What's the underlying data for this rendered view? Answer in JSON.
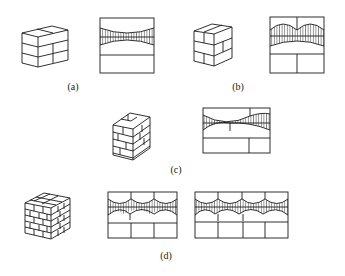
{
  "figure": {
    "panels": [
      {
        "id": "a",
        "label": "(a)",
        "description": "Three-course brick block (stacked bond) and elevation with single hatched zone between two slight arcs"
      },
      {
        "id": "b",
        "label": "(b)",
        "description": "Two-brick-wide stretcher bond block and elevation with two arches and hatched zone"
      },
      {
        "id": "c",
        "label": "(c)",
        "description": "Hollow brick column with bonded courses and elevation showing hatched zone with unequal arches"
      },
      {
        "id": "d",
        "label": "(d)",
        "description": "Larger bonded brick cube and two elevations with three and four arches of hatched zones"
      }
    ]
  },
  "colors": {
    "line": "#1a1a1a",
    "background": "#ffffff"
  }
}
